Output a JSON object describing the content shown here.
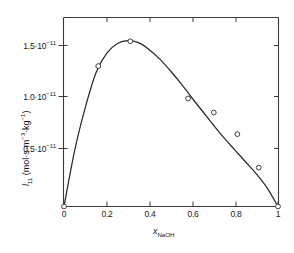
{
  "chart_data": {
    "type": "line",
    "title": "",
    "xlabel": "x_NaOH",
    "ylabel": "l_11 (mol·s·m⁻³·kg⁻¹)",
    "xlim": [
      0,
      1
    ],
    "ylim": [
      0,
      1.75e-11
    ],
    "grid": false,
    "legend": null,
    "x_tick_labels": [
      "0",
      "0.2",
      "0.4",
      "0.6",
      "0.8",
      "1"
    ],
    "x_tick_values": [
      0,
      0.2,
      0.4,
      0.6,
      0.8,
      1
    ],
    "y_tick_labels": [
      "0.5·10⁻¹¹",
      "1.0·10⁻¹¹",
      "1.5·10⁻¹¹"
    ],
    "y_tick_values": [
      5e-12,
      1e-11,
      1.5e-11
    ],
    "series": [
      {
        "name": "l11 data",
        "marker": "open-circle",
        "x": [
          0.0,
          0.16,
          0.31,
          0.58,
          0.7,
          0.81,
          0.91,
          1.0
        ],
        "y": [
          0.0,
          1.3e-11,
          1.53e-11,
          1e-11,
          8.7e-12,
          6.7e-12,
          3.6e-12,
          0.0
        ]
      },
      {
        "name": "fitted curve",
        "marker": "none",
        "x": [
          0.0,
          0.05,
          0.1,
          0.15,
          0.2,
          0.25,
          0.3,
          0.35,
          0.4,
          0.45,
          0.5,
          0.55,
          0.6,
          0.65,
          0.7,
          0.75,
          0.8,
          0.85,
          0.9,
          0.95,
          1.0
        ],
        "y": [
          0.0,
          5.2e-12,
          9.2e-12,
          1.24e-11,
          1.42e-11,
          1.51e-11,
          1.535e-11,
          1.515e-11,
          1.45e-11,
          1.36e-11,
          1.25e-11,
          1.13e-11,
          1e-11,
          8.75e-12,
          7.5e-12,
          6.3e-12,
          5.2e-12,
          4.1e-12,
          3e-12,
          1.7e-12,
          0.0
        ]
      }
    ]
  },
  "labels": {
    "y_title_symbol": "l",
    "y_title_subscript": "11",
    "y_title_units": " (mol·s·m",
    "y_title_exp1": "−3",
    "y_title_mid": "·kg",
    "y_title_exp2": "−1",
    "y_title_close": ")",
    "x_title_symbol": "x",
    "x_title_subscript": "NaOH",
    "ytick0": "0.5·10",
    "ytick0_exp": "−11",
    "ytick1": "1.0·10",
    "ytick1_exp": "−11",
    "ytick2": "1.5·10",
    "ytick2_exp": "−11",
    "xtick0": "0",
    "xtick1": "0.2",
    "xtick2": "0.4",
    "xtick3": "0.6",
    "xtick4": "0.8",
    "xtick5": "1"
  },
  "style": {
    "axis_color": "#3a3a3a",
    "curve_color": "#2a2a2a",
    "marker_color": "#2a2a2a",
    "background": "#ffffff"
  }
}
